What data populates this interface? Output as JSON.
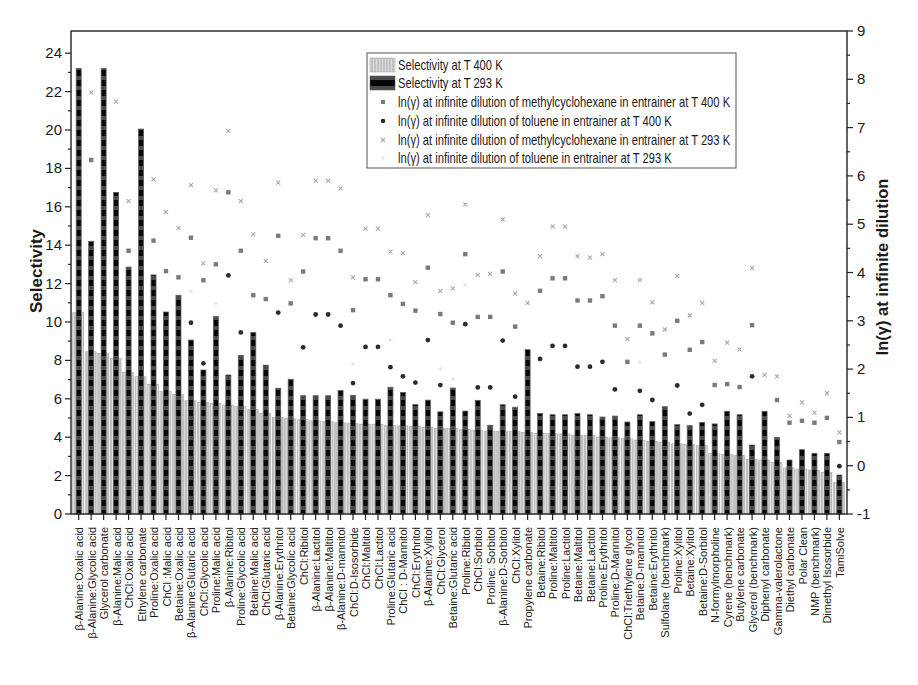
{
  "chart_data": {
    "type": "bar",
    "title": "",
    "xlabel": "",
    "ylabel": "Selectivity",
    "ylabel_right": "ln(γ) at infinite dilution",
    "ylim": [
      0,
      25.15
    ],
    "ylim_right": [
      -1,
      9
    ],
    "yticks": [
      0,
      2,
      4,
      6,
      8,
      10,
      12,
      14,
      16,
      18,
      20,
      22,
      24
    ],
    "yticks_right": [
      -1,
      0,
      1,
      2,
      3,
      4,
      5,
      6,
      7,
      8,
      9
    ],
    "grid": false,
    "legend_position": "inside, upper center",
    "categories": [
      "β-Alanine:Oxalic acid",
      "β-Alanine:Glycolic acid",
      "Glycerol carbonate",
      "β-Alanine:Malic acid",
      "ChCl:Oxalic acid",
      "Ethylene carbonate",
      "Proline:Oxalic acid",
      "ChCl :Malic acid",
      "Betaine:Oxalic acid",
      "β-Alanine:Glutaric acid",
      "ChCl:Glycolic acid",
      "Proline:Malic acid",
      "β-Alanine:Ribitol",
      "Proline:Glycolic acid",
      "Betaine:Malic acid",
      "ChCl:Glutaric acid",
      "β-Alanine:Erythritol",
      "Betaine:Glycolic acid",
      "ChCl:Ribitol",
      "β-Alanine:Lactitol",
      "β-Alanine:Maltitol",
      "β-Alanine:D-mannitol",
      "ChCl:D-Isosorbide",
      "ChCl:Maltitol",
      "ChCl:Lactitol",
      "Proline:Glutaric acid",
      "ChCl : D-Mannitol",
      "ChCl:Erythritol",
      "β-Alanine:Xylitol",
      "ChCl:Glycerol",
      "Betaine:Glutaric acid",
      "Proline:Ribitol",
      "ChCl:Sorbitol",
      "Proline: Sorbitol",
      "β-Alanine:D-Sorbitol",
      "ChCl:Xylitol",
      "Propylene carbonate",
      "Betaine:Ribitol",
      "Proline:Maltitol",
      "Proline:Lactitol",
      "Betaine:Maltitol",
      "Betaine:Lactitol",
      "Proline:Erythritol",
      "Proline:D-Mannitol",
      "ChCl:Triethylene glycol",
      "Betaine:D-mannitol",
      "Betaine:Erythritol",
      "Sulfolane (benchmark)",
      "Proline:Xylitol",
      "Betaine:Xylitol",
      "Betaine:D-Sorbitol",
      "N-formylmorpholine",
      "Cyrene (benchmark)",
      "Butylene carbonate",
      "Glycerol (benchmark)",
      "Diphenyl carbonate",
      "Gamma-valerolactone",
      "Diethyl carbonate",
      "Polar Clean",
      "NMP (benchmark)",
      "Dimethyl Isosorbide",
      "TamiSolve"
    ],
    "series": [
      {
        "key": "selectivity-400k",
        "name": "Selectivity at T 400 K",
        "type": "bar",
        "axis": "left",
        "color": "#c3c3c3",
        "values": [
          10.48,
          8.45,
          8.35,
          8.1,
          7.38,
          7.15,
          6.75,
          6.37,
          6.23,
          5.9,
          5.82,
          5.76,
          5.68,
          5.6,
          5.43,
          5.25,
          5.03,
          4.96,
          4.91,
          4.85,
          4.82,
          4.75,
          4.71,
          4.68,
          4.68,
          4.61,
          4.59,
          4.56,
          4.52,
          4.47,
          4.45,
          4.41,
          4.36,
          4.32,
          4.3,
          4.29,
          4.25,
          4.2,
          4.18,
          4.17,
          4.11,
          4.08,
          4.01,
          3.96,
          3.92,
          3.85,
          3.79,
          3.75,
          3.65,
          3.62,
          3.56,
          3.14,
          3.11,
          3.05,
          2.86,
          2.81,
          2.69,
          2.4,
          2.34,
          2.29,
          2.17,
          1.65
        ]
      },
      {
        "key": "selectivity-293k",
        "name": "Selectivity at T 293 K",
        "type": "bar",
        "axis": "left",
        "color": "#050505",
        "values": [
          23.2,
          14.2,
          23.2,
          16.75,
          12.86,
          20.05,
          12.45,
          10.52,
          11.39,
          9.06,
          7.5,
          10.28,
          7.24,
          8.26,
          9.45,
          7.75,
          6.55,
          7.02,
          6.16,
          6.16,
          6.16,
          6.43,
          6.17,
          5.98,
          5.98,
          6.6,
          6.33,
          5.7,
          5.93,
          5.32,
          6.56,
          5.36,
          5.92,
          4.62,
          5.69,
          5.56,
          8.56,
          5.23,
          5.17,
          5.17,
          5.23,
          5.17,
          5.05,
          5.1,
          4.79,
          5.17,
          4.81,
          5.59,
          4.65,
          4.6,
          4.77,
          4.69,
          5.35,
          5.17,
          3.59,
          5.35,
          3.99,
          2.81,
          3.35,
          3.16,
          3.16,
          2.03
        ]
      },
      {
        "key": "ln-gamma-mch-400k",
        "name": "ln(γ) at infinite dilution of methylcyclohexane in entrainer at T 400 K",
        "type": "scatter",
        "axis": "right",
        "marker": "square",
        "color": "#7a7a7a",
        "values": [
          null,
          6.33,
          null,
          null,
          4.45,
          null,
          4.66,
          4.03,
          3.9,
          4.72,
          3.84,
          4.17,
          5.66,
          4.45,
          3.53,
          3.45,
          4.76,
          3.36,
          4.02,
          4.71,
          4.71,
          4.45,
          3.22,
          3.86,
          3.86,
          3.53,
          3.35,
          3.21,
          4.1,
          3.14,
          2.96,
          4.38,
          3.08,
          3.08,
          4.02,
          2.88,
          null,
          3.62,
          3.88,
          3.88,
          3.42,
          3.42,
          3.51,
          2.9,
          2.15,
          2.9,
          2.74,
          2.3,
          3.0,
          2.4,
          2.56,
          1.67,
          1.69,
          1.63,
          2.91,
          null,
          1.36,
          0.89,
          0.93,
          0.89,
          0.99,
          0.49
        ]
      },
      {
        "key": "ln-gamma-toluene-400k",
        "name": "ln(γ) at infinite dilution of toluene in entrainer at T 400 K",
        "type": "scatter",
        "axis": "right",
        "marker": "circle",
        "color": "#2b2b2b",
        "values": [
          null,
          null,
          null,
          null,
          null,
          null,
          null,
          null,
          null,
          2.96,
          2.12,
          null,
          3.94,
          2.76,
          null,
          null,
          3.17,
          null,
          2.45,
          3.13,
          3.13,
          2.9,
          1.71,
          2.46,
          2.46,
          2.04,
          1.85,
          1.72,
          2.6,
          1.67,
          null,
          2.93,
          1.62,
          1.62,
          2.59,
          1.43,
          null,
          2.21,
          2.48,
          2.48,
          2.05,
          2.05,
          2.15,
          1.58,
          null,
          1.55,
          1.36,
          null,
          1.66,
          1.08,
          1.26,
          null,
          null,
          null,
          1.85,
          null,
          null,
          null,
          null,
          null,
          null,
          -0.01
        ]
      },
      {
        "key": "ln-gamma-mch-293k",
        "name": "ln(γ) at infinite dilution of methylcyclohexane in entrainer at T 293 K",
        "type": "scatter",
        "axis": "right",
        "marker": "x",
        "color": "#a8a8a8",
        "values": [
          null,
          7.73,
          null,
          7.54,
          5.48,
          null,
          5.93,
          5.25,
          4.92,
          5.81,
          4.19,
          5.7,
          6.93,
          5.48,
          4.79,
          4.24,
          5.86,
          3.84,
          4.78,
          5.9,
          5.9,
          5.74,
          3.9,
          4.91,
          4.91,
          4.43,
          4.4,
          3.8,
          5.19,
          3.62,
          3.67,
          5.41,
          3.95,
          3.97,
          5.1,
          3.57,
          3.37,
          4.34,
          4.95,
          4.95,
          4.34,
          4.31,
          4.38,
          3.84,
          2.62,
          3.84,
          3.38,
          2.82,
          3.93,
          3.11,
          3.37,
          2.17,
          2.55,
          2.41,
          4.09,
          1.88,
          1.85,
          1.03,
          1.31,
          1.1,
          1.5,
          0.69
        ]
      },
      {
        "key": "ln-gamma-toluene-293k",
        "name": "ln(γ) at infinite dilution of toluene in entrainer at T 293 K",
        "type": "scatter",
        "axis": "right",
        "marker": "plus",
        "color": "#e2e2e2",
        "values": [
          null,
          null,
          null,
          null,
          null,
          null,
          null,
          null,
          null,
          3.6,
          null,
          3.36,
          null,
          null,
          null,
          null,
          null,
          null,
          null,
          null,
          null,
          null,
          2.1,
          null,
          null,
          2.6,
          null,
          null,
          null,
          2.0,
          1.79,
          3.74,
          null,
          null,
          null,
          null,
          null,
          null,
          null,
          null,
          null,
          null,
          null,
          null,
          null,
          2.14,
          null,
          null,
          null,
          null,
          null,
          null,
          null,
          null,
          null,
          null,
          null,
          null,
          null,
          null,
          null,
          null
        ]
      }
    ]
  },
  "colors": {
    "axis": "#222222",
    "legend_border": "#555555",
    "background": "#ffffff"
  }
}
